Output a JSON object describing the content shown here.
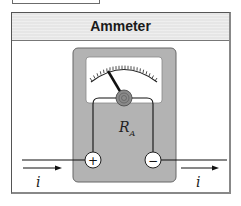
{
  "panel": {
    "title": "Ammeter"
  },
  "diagram": {
    "device": "ammeter",
    "internal_resistance_label": "R",
    "internal_resistance_subscript": "A",
    "terminals": [
      {
        "symbol": "+",
        "name": "positive"
      },
      {
        "symbol": "−",
        "name": "negative"
      }
    ],
    "current_labels": [
      "i",
      "i"
    ],
    "colors": {
      "device_body": "#b3b3b3",
      "meter_face": "#ffffff",
      "header": "#e6e6e6",
      "lines": "#1a1a1a"
    }
  }
}
